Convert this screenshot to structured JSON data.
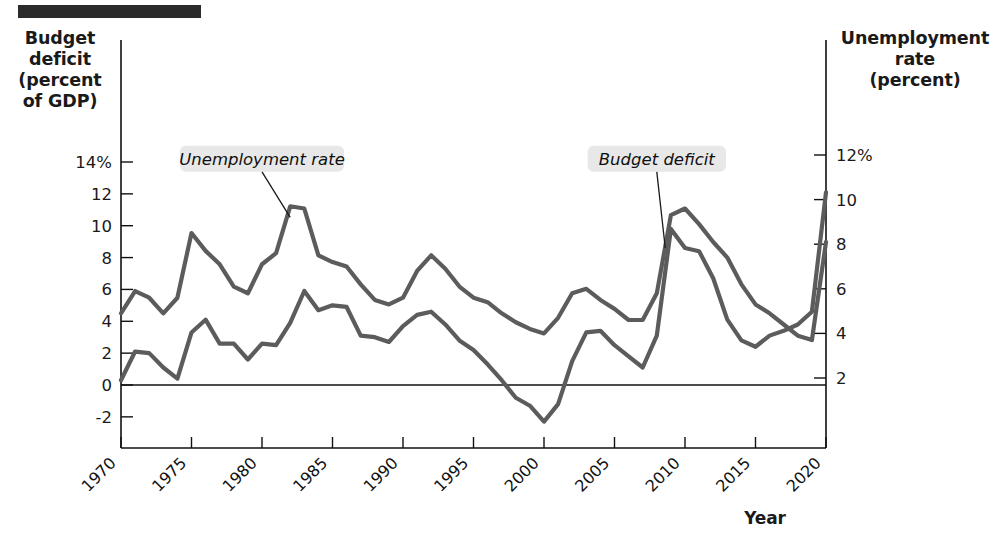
{
  "figure": {
    "rule_bar": "decorative-rule",
    "left_axis_title": "Budget deficit (percent of GDP)",
    "left_axis_title_lines": [
      "Budget",
      "deficit",
      "(percent",
      "of GDP)"
    ],
    "right_axis_title": "Unemployment rate (percent)",
    "right_axis_title_lines": [
      "Unemployment",
      "rate",
      "(percent)"
    ],
    "x_axis_title": "Year"
  },
  "chart_data": {
    "type": "line",
    "title": "",
    "subtitle": "",
    "xlabel": "Year",
    "ylabel": "Budget deficit (percent of GDP)",
    "y2label": "Unemployment rate (percent)",
    "grid": false,
    "legend": "annotated-callouts",
    "xlim": [
      1970,
      2020
    ],
    "ylim": [
      -3,
      15
    ],
    "y2lim": [
      1.2,
      12.8
    ],
    "xticks": [
      1970,
      1975,
      1980,
      1985,
      1990,
      1995,
      2000,
      2005,
      2010,
      2015,
      2020
    ],
    "xticklabels": [
      "1970",
      "1975",
      "1980",
      "1985",
      "1990",
      "1995",
      "2000",
      "2005",
      "2010",
      "2015",
      "2020"
    ],
    "yticks": [
      -2,
      0,
      2,
      4,
      6,
      8,
      10,
      12,
      14
    ],
    "yticklabels": [
      "-2",
      "0",
      "2",
      "4",
      "6",
      "8",
      "10",
      "12",
      "14%"
    ],
    "y2ticks": [
      2,
      4,
      6,
      8,
      10,
      12
    ],
    "y2ticklabels": [
      "2",
      "4",
      "6",
      "8",
      "10",
      "12%"
    ],
    "annotations": [
      {
        "text": "Unemployment rate",
        "x": 1980.0,
        "y": 14.2
      },
      {
        "text": "Budget deficit",
        "x": 2008.0,
        "y": 14.2
      }
    ],
    "x": [
      1970,
      1971,
      1972,
      1973,
      1974,
      1975,
      1976,
      1977,
      1978,
      1979,
      1980,
      1981,
      1982,
      1983,
      1984,
      1985,
      1986,
      1987,
      1988,
      1989,
      1990,
      1991,
      1992,
      1993,
      1994,
      1995,
      1996,
      1997,
      1998,
      1999,
      2000,
      2001,
      2002,
      2003,
      2004,
      2005,
      2006,
      2007,
      2008,
      2009,
      2010,
      2011,
      2012,
      2013,
      2014,
      2015,
      2016,
      2017,
      2018,
      2019,
      2020
    ],
    "series": [
      {
        "name": "Budget deficit",
        "axis": "left",
        "units": "percent of GDP",
        "color": "#5c5c5c",
        "values": [
          0.3,
          2.1,
          2.0,
          1.1,
          0.4,
          3.3,
          4.1,
          2.6,
          2.6,
          1.6,
          2.6,
          2.5,
          3.9,
          5.9,
          4.7,
          5.0,
          4.9,
          3.1,
          3.0,
          2.7,
          3.7,
          4.4,
          4.6,
          3.8,
          2.8,
          2.2,
          1.3,
          0.3,
          -0.8,
          -1.3,
          -2.3,
          -1.2,
          1.5,
          3.3,
          3.4,
          2.5,
          1.8,
          1.1,
          3.1,
          9.8,
          8.6,
          8.4,
          6.7,
          4.1,
          2.8,
          2.4,
          3.1,
          3.4,
          3.8,
          4.6,
          12.1
        ]
      },
      {
        "name": "Unemployment rate",
        "axis": "right",
        "units": "percent",
        "color": "#5c5c5c",
        "values": [
          4.9,
          5.9,
          5.6,
          4.9,
          5.6,
          8.5,
          7.7,
          7.1,
          6.1,
          5.8,
          7.1,
          7.6,
          9.7,
          9.6,
          7.5,
          7.2,
          7.0,
          6.2,
          5.5,
          5.3,
          5.6,
          6.8,
          7.5,
          6.9,
          6.1,
          5.6,
          5.4,
          4.9,
          4.5,
          4.2,
          4.0,
          4.7,
          5.8,
          6.0,
          5.5,
          5.1,
          4.6,
          4.6,
          5.8,
          9.3,
          9.6,
          8.9,
          8.1,
          7.4,
          6.2,
          5.3,
          4.9,
          4.4,
          3.9,
          3.7,
          8.1
        ]
      }
    ]
  }
}
